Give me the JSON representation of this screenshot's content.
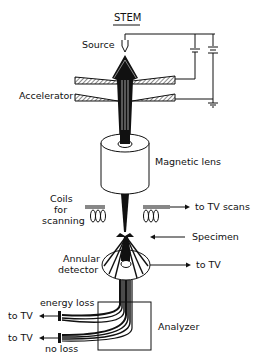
{
  "title": "STEM",
  "labels": {
    "source": "Source",
    "accelerator": "Accelerator",
    "magnetic_lens": "Magnetic lens",
    "coils": [
      "Coils",
      "for",
      "scanning"
    ],
    "to_tv_scans": "to TV scans",
    "specimen": "Specimen",
    "annular_detector": [
      "Annular",
      "detector"
    ],
    "to_tv_detector": "to TV",
    "energy_loss": "energy loss",
    "no_loss": "no loss",
    "to_tv_energy_loss": "to TV",
    "to_tv_no_loss": "to TV",
    "analyzer": "Analyzer"
  },
  "colors": {
    "ink": "#111111",
    "background": "#ffffff"
  }
}
